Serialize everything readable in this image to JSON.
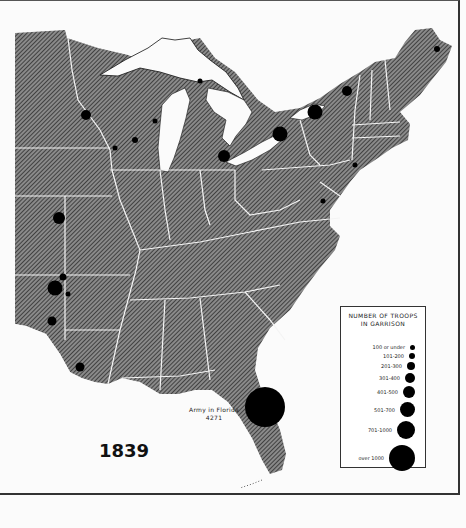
{
  "map": {
    "year": "1839",
    "annotation": {
      "label": "Army in Florida",
      "value": "4271"
    },
    "legend": {
      "title_line1": "NUMBER OF TROOPS",
      "title_line2": "IN GARRISON",
      "items": [
        {
          "label": "100 or under",
          "diameter": 5
        },
        {
          "label": "101-200",
          "diameter": 6
        },
        {
          "label": "201-300",
          "diameter": 8
        },
        {
          "label": "301-400",
          "diameter": 10
        },
        {
          "label": "401-500",
          "diameter": 12
        },
        {
          "label": "501-700",
          "diameter": 15
        },
        {
          "label": "701-1000",
          "diameter": 18
        },
        {
          "label": "over 1000",
          "diameter": 26
        }
      ]
    },
    "colors": {
      "land_hatch": "#555555",
      "boundaries": "#ffffff",
      "water": "#fbfbfb",
      "markers": "#000000"
    },
    "garrisons": [
      {
        "name": "maine-northeast",
        "x": 437,
        "y": 49,
        "d": 6
      },
      {
        "name": "vermont-north",
        "x": 347,
        "y": 91,
        "d": 10
      },
      {
        "name": "lake-ontario",
        "x": 315,
        "y": 112,
        "d": 15
      },
      {
        "name": "buffalo",
        "x": 280,
        "y": 134,
        "d": 15
      },
      {
        "name": "detroit",
        "x": 224,
        "y": 156,
        "d": 12
      },
      {
        "name": "new-york-harbor",
        "x": 355,
        "y": 165,
        "d": 5
      },
      {
        "name": "baltimore",
        "x": 323,
        "y": 201,
        "d": 5
      },
      {
        "name": "mackinac",
        "x": 200,
        "y": 81,
        "d": 5
      },
      {
        "name": "upper-mississippi",
        "x": 86,
        "y": 115,
        "d": 10
      },
      {
        "name": "green-bay",
        "x": 155,
        "y": 121,
        "d": 5
      },
      {
        "name": "prairie-du-chien",
        "x": 135,
        "y": 140,
        "d": 6
      },
      {
        "name": "fort-crawford",
        "x": 115,
        "y": 148,
        "d": 5
      },
      {
        "name": "fort-leavenworth",
        "x": 59,
        "y": 218,
        "d": 12
      },
      {
        "name": "fort-gibson-north",
        "x": 63,
        "y": 277,
        "d": 7
      },
      {
        "name": "fort-gibson",
        "x": 55,
        "y": 288,
        "d": 15
      },
      {
        "name": "fort-smith",
        "x": 68,
        "y": 294,
        "d": 5
      },
      {
        "name": "fort-towson",
        "x": 52,
        "y": 321,
        "d": 9
      },
      {
        "name": "fort-jesup",
        "x": 80,
        "y": 367,
        "d": 9
      },
      {
        "name": "florida-army",
        "x": 265,
        "y": 407,
        "d": 40
      }
    ]
  }
}
